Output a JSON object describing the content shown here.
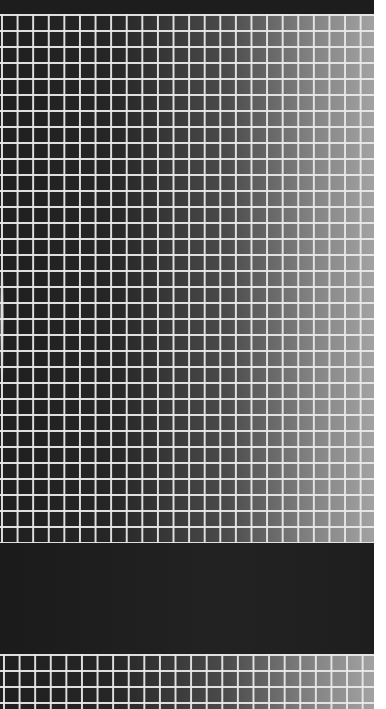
{
  "image": {
    "description": "Photograph of a white grid pattern over a dark-to-light horizontal gradient, with a dark band at the top and a wide dark band near the bottom",
    "colors": {
      "grid_lines": "#e8e8e8",
      "gradient_left": "#1f1f1f",
      "gradient_right": "#a2a2a2",
      "dark_band": "#1e1e1e",
      "background": "#ffffff"
    }
  }
}
